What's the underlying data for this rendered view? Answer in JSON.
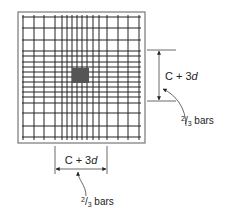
{
  "diagram": {
    "type": "slab-reinforcement-plan",
    "slab": {
      "x": 18,
      "y": 12,
      "width": 127,
      "height": 131,
      "border_color": "#777777"
    },
    "grid": {
      "color": "#222222",
      "vertical_x": [
        23,
        34,
        44,
        55,
        62,
        67,
        72,
        77,
        82,
        87,
        93,
        99,
        107,
        118,
        128,
        139
      ],
      "horizontal_y": [
        17,
        28,
        40,
        51,
        56,
        62,
        67,
        72,
        77,
        82,
        87,
        92,
        97,
        103,
        113,
        126,
        137
      ]
    },
    "column": {
      "x": 72,
      "y": 68,
      "width": 17,
      "height": 15,
      "color": "#555555"
    },
    "right_dimension": {
      "label_prefix": "C + 3",
      "label_var": "d",
      "note_num": "2",
      "note_den": "3",
      "note_text": " bars"
    },
    "bottom_dimension": {
      "label_prefix": "C + 3",
      "label_var": "d",
      "note_num": "2",
      "note_den": "3",
      "note_text": " bars"
    }
  }
}
